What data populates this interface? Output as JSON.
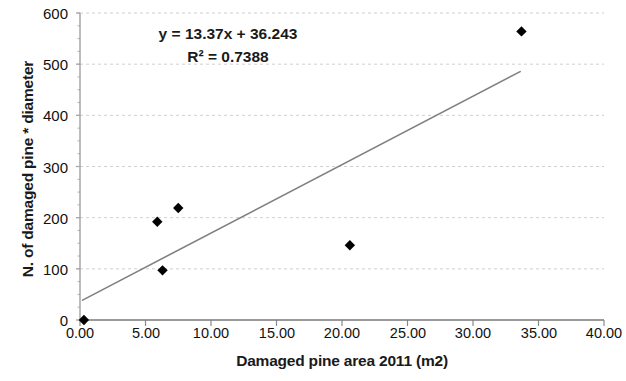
{
  "chart_data": {
    "type": "scatter",
    "title": "",
    "xlabel": "Damaged pine area 2011 (m2)",
    "ylabel": "N. of damaged pine * diameter",
    "xlim": [
      0,
      40
    ],
    "ylim": [
      0,
      600
    ],
    "xticks": [
      "0.00",
      "5.00",
      "10.00",
      "15.00",
      "20.00",
      "25.00",
      "30.00",
      "35.00",
      "40.00"
    ],
    "xtick_values": [
      0,
      5,
      10,
      15,
      20,
      25,
      30,
      35,
      40
    ],
    "yticks": [
      "0",
      "100",
      "200",
      "300",
      "400",
      "500",
      "600"
    ],
    "ytick_values": [
      0,
      100,
      200,
      300,
      400,
      500,
      600
    ],
    "grid": "horizontal-dashed",
    "legend": "none",
    "marker": "diamond",
    "marker_color": "#000000",
    "trendline_color": "#808080",
    "points": [
      {
        "x": 0.3,
        "y": 0
      },
      {
        "x": 5.9,
        "y": 192
      },
      {
        "x": 6.3,
        "y": 97
      },
      {
        "x": 7.5,
        "y": 219
      },
      {
        "x": 20.6,
        "y": 146
      },
      {
        "x": 33.7,
        "y": 564
      }
    ],
    "trendline": {
      "slope": 13.37,
      "intercept": 36.243,
      "x_start": 0.2,
      "x_end": 33.6
    },
    "annotations": {
      "equation": "y = 13.37x + 36.243",
      "r_squared": "R² = 0.7388"
    }
  }
}
